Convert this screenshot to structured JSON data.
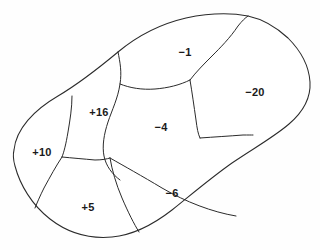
{
  "diagram": {
    "kind": "region-partition-map",
    "canvas": {
      "width": 320,
      "height": 250
    },
    "colors": {
      "background": "#ffffff",
      "line": "#2b2b2b",
      "label_text": "#1a1a1a",
      "region_fill": "#ffffff"
    },
    "outline": {
      "name": "outer-boundary",
      "path": "M 14 150 C 16 129, 34 110, 58 96 C 80 83, 100 67, 118 52 C 136 37, 160 24, 186 18 C 210 13, 232 13, 248 16 C 262 19, 275 26, 288 38 C 300 50, 309 66, 310 82 C 311 98, 303 112, 289 124 C 274 137, 254 148, 232 163 C 212 177, 192 194, 172 210 C 154 224, 134 235, 112 237 C 90 239, 68 233, 50 219 C 32 205, 20 185, 15 166 C 13 159, 13 154, 14 150 Z"
    },
    "dividers": [
      {
        "name": "divider-top-left-ridge",
        "path": "M 118 52 C 120 62, 122 72, 120 84 C 118 98, 112 110, 108 122 C 104 134, 102 146, 104 156 C 106 166, 112 174, 120 180"
      },
      {
        "name": "divider-neg1-bottom",
        "path": "M 120 84 C 130 88, 142 90, 155 89 C 168 88, 180 85, 190 80"
      },
      {
        "name": "divider-neg1-right",
        "path": "M 190 80 C 196 72, 204 64, 212 56 C 220 48, 230 38, 238 26 C 242 21, 245 18, 248 16"
      },
      {
        "name": "divider-neg20-left",
        "path": "M 190 80 C 192 92, 194 106, 196 120 C 197 128, 198 134, 200 138"
      },
      {
        "name": "divider-neg20-bottom",
        "path": "M 200 138 C 214 137, 230 136, 243 135 C 248 135, 251 135, 253 135"
      },
      {
        "name": "divider-plus10-right",
        "path": "M 72 96 C 72 108, 70 120, 68 132 C 66 144, 64 152, 62 157"
      },
      {
        "name": "divider-plus10-lower",
        "path": "M 62 157 C 56 166, 50 177, 44 188 C 40 196, 37 203, 35 208"
      },
      {
        "name": "divider-plus16-bottom",
        "path": "M 62 157 C 72 158, 84 159, 95 160 C 102 160, 107 159, 110 158"
      },
      {
        "name": "divider-plus5-right",
        "path": "M 110 158 C 112 170, 116 184, 122 198 C 128 212, 134 224, 139 232"
      },
      {
        "name": "divider-neg4-bottom",
        "path": "M 110 158 C 124 166, 142 176, 162 188 C 186 202, 212 212, 236 216"
      }
    ],
    "regions": [
      {
        "id": "region-plus10",
        "label": "+10",
        "value": 10,
        "label_x": 42,
        "label_y": 153,
        "sign": "positive"
      },
      {
        "id": "region-plus16",
        "label": "+16",
        "value": 16,
        "label_x": 99,
        "label_y": 113,
        "sign": "positive"
      },
      {
        "id": "region-plus5",
        "label": "+5",
        "value": 5,
        "label_x": 88,
        "label_y": 208,
        "sign": "positive"
      },
      {
        "id": "region-neg1",
        "label": "−1",
        "value": -1,
        "label_x": 185,
        "label_y": 53,
        "sign": "negative"
      },
      {
        "id": "region-neg4",
        "label": "−4",
        "value": -4,
        "label_x": 161,
        "label_y": 128,
        "sign": "negative"
      },
      {
        "id": "region-neg6",
        "label": "−6",
        "value": -6,
        "label_x": 172,
        "label_y": 194,
        "sign": "negative"
      },
      {
        "id": "region-neg20",
        "label": "−20",
        "value": -20,
        "label_x": 255,
        "label_y": 93,
        "sign": "negative"
      }
    ]
  }
}
